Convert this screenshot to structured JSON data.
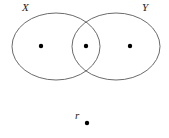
{
  "figure": {
    "type": "venn-diagram",
    "background_color": "#ffffff",
    "stroke_color": "#5a5a5a",
    "dot_color": "#000000",
    "width": 169,
    "height": 138
  },
  "sets": [
    {
      "id": "set-x",
      "label": "X",
      "cx": 56,
      "cy": 46.5,
      "rx": 44,
      "ry": 33.5
    },
    {
      "id": "set-y",
      "label": "Y",
      "cx": 116,
      "cy": 46.5,
      "rx": 44,
      "ry": 33.5
    }
  ],
  "points": [
    {
      "id": "point-x-only",
      "label": "",
      "cx": 41,
      "cy": 46,
      "r": 2.2,
      "region": "X only"
    },
    {
      "id": "point-intersection",
      "label": "",
      "cx": 86,
      "cy": 46,
      "r": 2.2,
      "region": "X and Y"
    },
    {
      "id": "point-y-only",
      "label": "",
      "cx": 130,
      "cy": 46,
      "r": 2.2,
      "region": "Y only"
    },
    {
      "id": "point-r",
      "label": "r",
      "cx": 87,
      "cy": 123,
      "r": 2.2,
      "region": "outside"
    }
  ],
  "labels": {
    "set_x": "X",
    "set_y": "Y",
    "point_r": "r"
  }
}
